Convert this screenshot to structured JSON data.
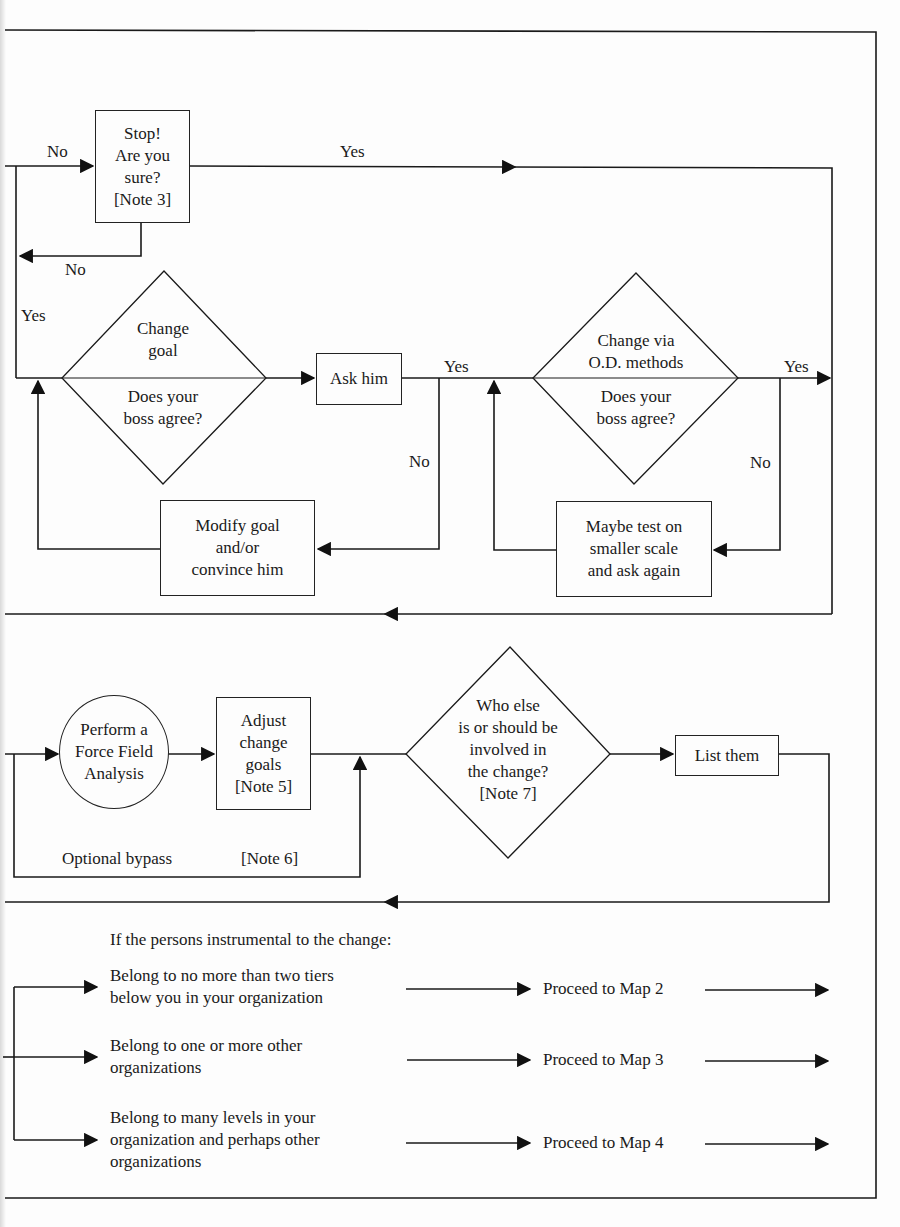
{
  "diagram": {
    "top_section": {
      "stop_box": {
        "label": "Stop!\nAre you\nsure?\n[Note 3]"
      },
      "edge_in_no": "No",
      "edge_out_yes": "Yes",
      "edge_back_no": "No",
      "edge_left_yes": "Yes"
    },
    "goal_section": {
      "diamond": {
        "top": "Change\ngoal",
        "bottom": "Does your\nboss agree?"
      },
      "ask_box": {
        "label": "Ask him"
      },
      "ask_yes": "Yes",
      "ask_no": "No",
      "modify_box": {
        "label": "Modify goal\nand/or\nconvince him"
      }
    },
    "od_section": {
      "diamond": {
        "top": "Change via\nO.D. methods",
        "bottom": "Does your\nboss agree?"
      },
      "edge_yes": "Yes",
      "edge_no": "No",
      "maybe_box": {
        "label": "Maybe test on\nsmaller scale\nand ask again"
      }
    },
    "force_section": {
      "circle": {
        "label": "Perform a\nForce Field\nAnalysis"
      },
      "adjust_box": {
        "label": "Adjust\nchange\ngoals\n[Note 5]"
      },
      "bypass_label": "Optional bypass",
      "bypass_note": "[Note 6]",
      "who_diamond": {
        "label": "Who else\nis or should be\ninvolved in\nthe change?\n[Note 7]"
      },
      "list_box": {
        "label": "List them"
      }
    },
    "routing_section": {
      "intro": "If the persons instrumental to the change:",
      "conditions": [
        {
          "text": "Belong to no more than two tiers\nbelow you in your organization",
          "target": "Proceed to Map 2"
        },
        {
          "text": "Belong to one or more other\norganizations",
          "target": "Proceed to Map 3"
        },
        {
          "text": "Belong to many levels in your\norganization and perhaps other\norganizations",
          "target": "Proceed to Map 4"
        }
      ]
    }
  }
}
